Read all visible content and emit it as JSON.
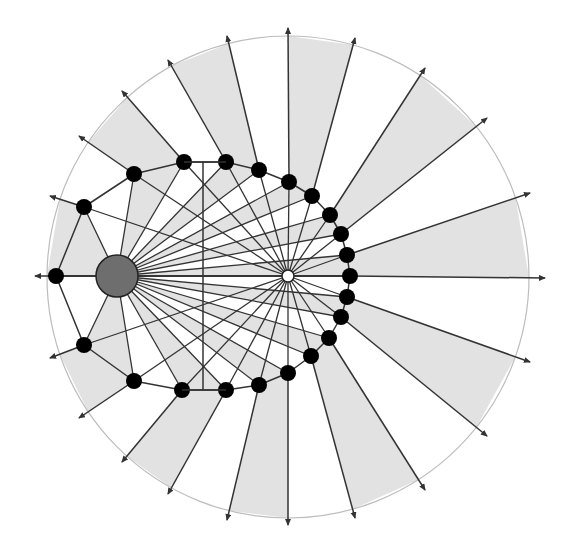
{
  "diagram": {
    "width": 574,
    "height": 544,
    "colors": {
      "background": "#ffffff",
      "shade": "#e2e2e2",
      "boundary_circle": "#bdbdbd",
      "line": "#333333",
      "node_fill": "#000000",
      "source_fill": "#6e6e6e",
      "focus_fill": "#ffffff"
    },
    "boundary_circle": {
      "cx": 288,
      "cy": 277,
      "r": 241
    },
    "source": {
      "label": "source",
      "cx": 117,
      "cy": 276,
      "r": 21
    },
    "focus": {
      "label": "focus",
      "cx": 288,
      "cy": 276,
      "r": 6
    },
    "vertical_segment": {
      "x": 203,
      "y1": 162,
      "y2": 390
    },
    "ellipse_arc": {
      "cx": 203,
      "cy": 276,
      "rx": 147,
      "ry": 114
    },
    "nodes": [
      [
        56,
        276
      ],
      [
        84,
        207
      ],
      [
        134,
        174
      ],
      [
        184,
        162
      ],
      [
        226,
        162
      ],
      [
        259,
        170
      ],
      [
        289,
        182
      ],
      [
        312,
        196
      ],
      [
        330,
        215
      ],
      [
        341,
        234
      ],
      [
        347,
        255
      ],
      [
        350,
        276
      ],
      [
        347,
        297
      ],
      [
        341,
        317
      ],
      [
        329,
        338
      ],
      [
        311,
        356
      ],
      [
        288,
        373
      ],
      [
        259,
        385
      ],
      [
        226,
        390
      ],
      [
        182,
        390
      ],
      [
        134,
        381
      ],
      [
        84,
        345
      ]
    ],
    "rays": [
      {
        "from": [
          56,
          276
        ],
        "to": [
          35,
          276
        ]
      },
      {
        "from": [
          84,
          207
        ],
        "to": [
          50,
          196
        ]
      },
      {
        "from": [
          134,
          174
        ],
        "to": [
          79,
          136
        ]
      },
      {
        "from": [
          184,
          162
        ],
        "to": [
          122,
          91
        ]
      },
      {
        "from": [
          226,
          162
        ],
        "to": [
          168,
          60
        ]
      },
      {
        "from": [
          259,
          170
        ],
        "to": [
          227,
          36
        ]
      },
      {
        "from": [
          289,
          182
        ],
        "to": [
          288,
          28
        ]
      },
      {
        "from": [
          312,
          196
        ],
        "to": [
          355,
          38
        ]
      },
      {
        "from": [
          330,
          215
        ],
        "to": [
          425,
          68
        ]
      },
      {
        "from": [
          341,
          234
        ],
        "to": [
          487,
          118
        ]
      },
      {
        "from": [
          347,
          255
        ],
        "to": [
          530,
          193
        ]
      },
      {
        "from": [
          350,
          276
        ],
        "to": [
          545,
          278
        ]
      },
      {
        "from": [
          347,
          297
        ],
        "to": [
          530,
          362
        ]
      },
      {
        "from": [
          341,
          317
        ],
        "to": [
          487,
          436
        ]
      },
      {
        "from": [
          329,
          338
        ],
        "to": [
          425,
          490
        ]
      },
      {
        "from": [
          311,
          356
        ],
        "to": [
          355,
          518
        ]
      },
      {
        "from": [
          288,
          373
        ],
        "to": [
          288,
          525
        ]
      },
      {
        "from": [
          259,
          385
        ],
        "to": [
          227,
          520
        ]
      },
      {
        "from": [
          226,
          390
        ],
        "to": [
          168,
          494
        ]
      },
      {
        "from": [
          182,
          390
        ],
        "to": [
          122,
          462
        ]
      },
      {
        "from": [
          134,
          381
        ],
        "to": [
          79,
          418
        ]
      },
      {
        "from": [
          84,
          345
        ],
        "to": [
          50,
          358
        ]
      }
    ],
    "shaded_sectors": [
      [
        0,
        1
      ],
      [
        2,
        3
      ],
      [
        4,
        5
      ],
      [
        6,
        7
      ],
      [
        8,
        9
      ],
      [
        10,
        11
      ],
      [
        12,
        13
      ],
      [
        14,
        15
      ],
      [
        16,
        17
      ],
      [
        18,
        19
      ],
      [
        20,
        21
      ]
    ]
  }
}
